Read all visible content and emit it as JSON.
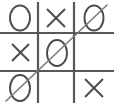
{
  "app": {
    "title": "Tic-Tac-Toe Board",
    "description": "Completed tic-tac-toe game with a diagonal winning line"
  },
  "board": {
    "rows": 3,
    "columns": 3,
    "empty_label": "",
    "cells": [
      {
        "id": "cell-r1c1",
        "row": 1,
        "col": 1,
        "mark": "O",
        "winning": false
      },
      {
        "id": "cell-r1c2",
        "row": 1,
        "col": 2,
        "mark": "X",
        "winning": false
      },
      {
        "id": "cell-r1c3",
        "row": 1,
        "col": 3,
        "mark": "O",
        "winning": true
      },
      {
        "id": "cell-r2c1",
        "row": 2,
        "col": 1,
        "mark": "X",
        "winning": false
      },
      {
        "id": "cell-r2c2",
        "row": 2,
        "col": 2,
        "mark": "O",
        "winning": true
      },
      {
        "id": "cell-r2c3",
        "row": 2,
        "col": 3,
        "mark": "",
        "winning": false
      },
      {
        "id": "cell-r3c1",
        "row": 3,
        "col": 1,
        "mark": "O",
        "winning": true
      },
      {
        "id": "cell-r3c2",
        "row": 3,
        "col": 2,
        "mark": "",
        "winning": false
      },
      {
        "id": "cell-r3c3",
        "row": 3,
        "col": 3,
        "mark": "X",
        "winning": false
      }
    ]
  },
  "result": {
    "winner": "O",
    "win_type": "anti-diagonal",
    "win_cells": [
      "cell-r1c3",
      "cell-r2c2",
      "cell-r3c1"
    ]
  },
  "colors": {
    "background": "#ffffff",
    "grid": "#58585c",
    "mark": "#4c4c50",
    "win_line": "#7a7a80"
  },
  "geometry": {
    "width": 114,
    "height": 110,
    "vertical_lines_x": [
      38,
      74
    ],
    "horizontal_lines_y": [
      33,
      71
    ],
    "vertical_line_top": 2,
    "vertical_line_bottom": 103,
    "horizontal_line_left": 0,
    "horizontal_line_right": 114,
    "win_line_start": [
      6,
      101
    ],
    "win_line_end": [
      107,
      5
    ]
  }
}
